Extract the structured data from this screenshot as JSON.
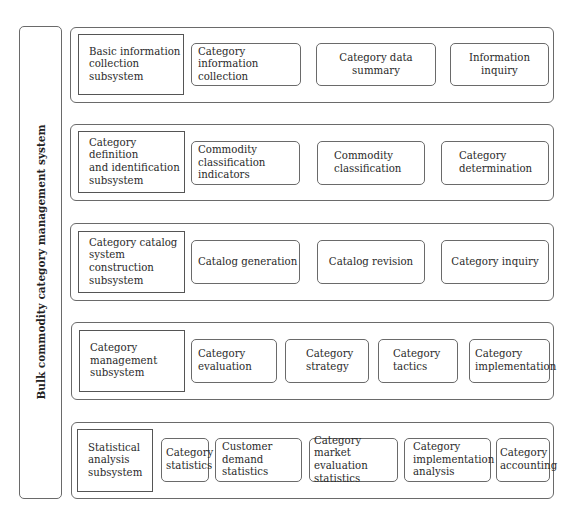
{
  "system": {
    "title": "Bulk commodity category management system"
  },
  "rows": [
    {
      "subsystem": "Basic information\ncollection subsystem",
      "functions": [
        "Category information\ncollection",
        "Category data summary",
        "Information inquiry"
      ]
    },
    {
      "subsystem": "Category definition\nand identification\nsubsystem",
      "functions": [
        "Commodity\nclassification indicators",
        "Commodity\nclassification",
        "Category\ndetermination"
      ]
    },
    {
      "subsystem": "Category catalog\nsystem construction\nsubsystem",
      "functions": [
        "Catalog generation",
        "Catalog revision",
        "Category inquiry"
      ]
    },
    {
      "subsystem": "Category\nmanagement\nsubsystem",
      "functions": [
        "Category\nevaluation",
        "Category\nstrategy",
        "Category\ntactics",
        "Category\nimplementation"
      ]
    },
    {
      "subsystem": "Statistical\nanalysis\nsubsystem",
      "functions": [
        "Category\nstatistics",
        "Customer\ndemand statistics",
        "Category market\nevaluation statistics",
        "Category\nimplementation\nanalysis",
        "Category\naccounting"
      ]
    }
  ],
  "colors": {
    "border": "#6a6a6a",
    "text": "#2a2a2a",
    "background": "#ffffff"
  }
}
